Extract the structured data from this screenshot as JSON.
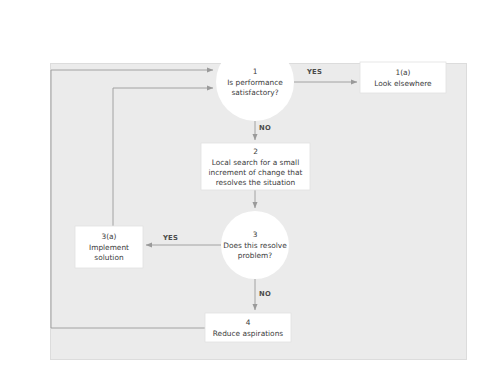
{
  "figure": {
    "panel_bg": "#ebebeb",
    "node_fill": "#ffffff",
    "line_color": "#9a9a9a",
    "text_color": "#3b3b3b",
    "watermark": ""
  },
  "nodes": [
    {
      "id": "node-1",
      "shape": "circle",
      "number": "1",
      "text_lines": [
        "Is performance",
        "satisfactory?"
      ],
      "cx": 255,
      "cy": 82,
      "r": 39
    },
    {
      "id": "node-1a",
      "shape": "rect",
      "number": "1(a)",
      "text_lines": [
        "Look elsewhere"
      ],
      "x": 360,
      "y": 62,
      "w": 86,
      "h": 31
    },
    {
      "id": "node-2",
      "shape": "rect",
      "number": "2",
      "text_lines": [
        "Local search for a small",
        "increment of change that",
        "resolves the situation"
      ],
      "x": 201,
      "y": 143,
      "w": 109,
      "h": 47
    },
    {
      "id": "node-3",
      "shape": "circle",
      "number": "3",
      "text_lines": [
        "Does this resolve",
        "problem?"
      ],
      "cx": 255,
      "cy": 245,
      "r": 34
    },
    {
      "id": "node-3a",
      "shape": "rect",
      "number": "3(a)",
      "text_lines": [
        "Implement",
        "solution"
      ],
      "x": 75,
      "y": 226,
      "w": 68,
      "h": 42
    },
    {
      "id": "node-4",
      "shape": "rect",
      "number": "4",
      "text_lines": [
        "Reduce aspirations"
      ],
      "x": 205,
      "y": 313,
      "w": 86,
      "h": 29
    }
  ],
  "edge_labels": [
    {
      "id": "yes-1",
      "text": "YES",
      "x": 307,
      "y": 62
    },
    {
      "id": "no-1",
      "text": "NO",
      "x": 259,
      "y": 126
    },
    {
      "id": "yes-3",
      "text": "YES",
      "x": 175,
      "y": 235
    },
    {
      "id": "no-3",
      "text": "NO",
      "x": 259,
      "y": 292
    }
  ],
  "node_text": {
    "node_1_num": "1",
    "node_1_l1": "Is performance",
    "node_1_l2": "satisfactory?",
    "node_1a_num": "1(a)",
    "node_1a_l1": "Look elsewhere",
    "node_2_num": "2",
    "node_2_l1": "Local search for a small",
    "node_2_l2": "increment of change that",
    "node_2_l3": "resolves the situation",
    "node_3_num": "3",
    "node_3_l1": "Does this resolve",
    "node_3_l2": "problem?",
    "node_3a_num": "3(a)",
    "node_3a_l1": "Implement",
    "node_3a_l2": "solution",
    "node_4_num": "4",
    "node_4_l1": "Reduce aspirations"
  },
  "labels": {
    "yes_top": "YES",
    "no_top": "NO",
    "yes_mid": "YES",
    "no_bottom": "NO"
  }
}
